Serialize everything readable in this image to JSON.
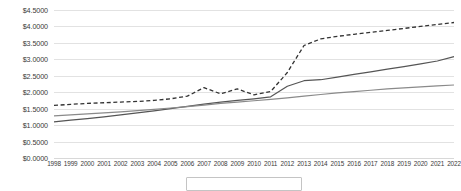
{
  "chart_data": {
    "type": "line",
    "title": "",
    "xlabel": "",
    "ylabel": "",
    "ylim": [
      0,
      4.5
    ],
    "y_tick_step": 0.5,
    "grid": true,
    "legend_position": "bottom",
    "value_prefix": "$",
    "y_tick_labels": [
      "$4.5000",
      "$4.0000",
      "$3.5000",
      "$3.0000",
      "$2.5000",
      "$2.0000",
      "$1.5000",
      "$1.0000",
      "$0.5000",
      "$0.0000"
    ],
    "y_tick_values": [
      4.5,
      4.0,
      3.5,
      3.0,
      2.5,
      2.0,
      1.5,
      1.0,
      0.5,
      0.0
    ],
    "categories": [
      "1998",
      "1999",
      "2000",
      "2001",
      "2002",
      "2003",
      "2004",
      "2005",
      "2006",
      "2007",
      "2008",
      "2009",
      "2010",
      "2011",
      "2012",
      "2013",
      "2014",
      "2015",
      "2016",
      "2017",
      "2018",
      "2019",
      "2020",
      "2021",
      "2022"
    ],
    "series": [
      {
        "name": "series-dashed",
        "style": "dashed",
        "color": "#333333",
        "values": [
          1.6,
          1.63,
          1.66,
          1.68,
          1.7,
          1.72,
          1.75,
          1.8,
          1.88,
          2.14,
          1.95,
          2.1,
          1.92,
          2.02,
          2.6,
          3.42,
          3.62,
          3.7,
          3.76,
          3.82,
          3.88,
          3.94,
          4.0,
          4.06,
          4.12
        ]
      },
      {
        "name": "series-solid-upper",
        "style": "solid",
        "color": "#555555",
        "values": [
          1.1,
          1.15,
          1.2,
          1.25,
          1.31,
          1.37,
          1.43,
          1.5,
          1.57,
          1.64,
          1.7,
          1.75,
          1.8,
          1.86,
          2.18,
          2.35,
          2.38,
          2.46,
          2.54,
          2.62,
          2.7,
          2.78,
          2.86,
          2.95,
          3.08
        ]
      },
      {
        "name": "series-solid-lower",
        "style": "solid",
        "color": "#8a8a8a",
        "values": [
          1.28,
          1.31,
          1.34,
          1.37,
          1.4,
          1.44,
          1.48,
          1.52,
          1.56,
          1.61,
          1.66,
          1.7,
          1.74,
          1.78,
          1.83,
          1.88,
          1.93,
          1.98,
          2.02,
          2.06,
          2.1,
          2.13,
          2.16,
          2.19,
          2.22
        ]
      }
    ],
    "legend": {
      "visible": true,
      "cropped": true,
      "entries": []
    }
  }
}
